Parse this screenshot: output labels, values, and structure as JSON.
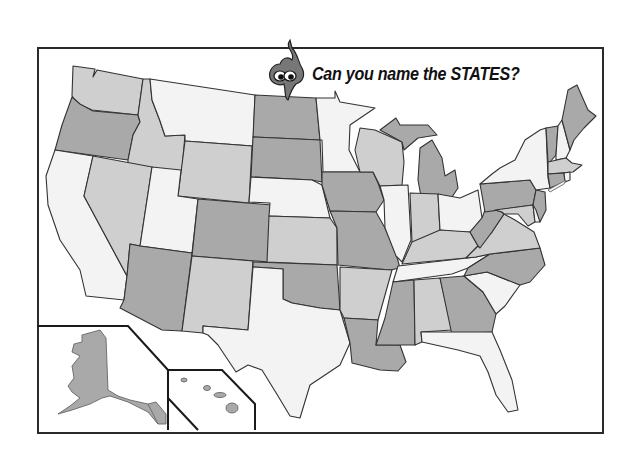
{
  "title": "Can you name the STATES?",
  "mascot": "flame-head-cartoon-character",
  "colors": {
    "dark": "#a9a9a9",
    "medium": "#cfcfcf",
    "light": "#f3f3f3",
    "border": "#2a2a2a",
    "background": "#ffffff"
  },
  "map": {
    "type": "blank-us-states-quiz-map",
    "labels_shown": false,
    "insets": [
      "Alaska",
      "Hawaii"
    ],
    "states": [
      {
        "name": "Washington",
        "shade": "medium"
      },
      {
        "name": "Oregon",
        "shade": "dark"
      },
      {
        "name": "California",
        "shade": "light"
      },
      {
        "name": "Idaho",
        "shade": "medium"
      },
      {
        "name": "Nevada",
        "shade": "medium"
      },
      {
        "name": "Montana",
        "shade": "light"
      },
      {
        "name": "Wyoming",
        "shade": "medium"
      },
      {
        "name": "Utah",
        "shade": "light"
      },
      {
        "name": "Arizona",
        "shade": "dark"
      },
      {
        "name": "Colorado",
        "shade": "dark"
      },
      {
        "name": "New Mexico",
        "shade": "medium"
      },
      {
        "name": "North Dakota",
        "shade": "dark"
      },
      {
        "name": "South Dakota",
        "shade": "dark"
      },
      {
        "name": "Nebraska",
        "shade": "light"
      },
      {
        "name": "Kansas",
        "shade": "medium"
      },
      {
        "name": "Oklahoma",
        "shade": "dark"
      },
      {
        "name": "Texas",
        "shade": "light"
      },
      {
        "name": "Minnesota",
        "shade": "light"
      },
      {
        "name": "Iowa",
        "shade": "dark"
      },
      {
        "name": "Missouri",
        "shade": "dark"
      },
      {
        "name": "Arkansas",
        "shade": "medium"
      },
      {
        "name": "Louisiana",
        "shade": "dark"
      },
      {
        "name": "Wisconsin",
        "shade": "medium"
      },
      {
        "name": "Illinois",
        "shade": "light"
      },
      {
        "name": "Michigan",
        "shade": "dark"
      },
      {
        "name": "Indiana",
        "shade": "medium"
      },
      {
        "name": "Ohio",
        "shade": "light"
      },
      {
        "name": "Kentucky",
        "shade": "medium"
      },
      {
        "name": "Tennessee",
        "shade": "light"
      },
      {
        "name": "Mississippi",
        "shade": "dark"
      },
      {
        "name": "Alabama",
        "shade": "medium"
      },
      {
        "name": "Georgia",
        "shade": "dark"
      },
      {
        "name": "Florida",
        "shade": "light"
      },
      {
        "name": "South Carolina",
        "shade": "light"
      },
      {
        "name": "North Carolina",
        "shade": "dark"
      },
      {
        "name": "Virginia",
        "shade": "medium"
      },
      {
        "name": "West Virginia",
        "shade": "dark"
      },
      {
        "name": "Pennsylvania",
        "shade": "dark"
      },
      {
        "name": "New York",
        "shade": "light"
      },
      {
        "name": "New Jersey",
        "shade": "dark"
      },
      {
        "name": "Delaware",
        "shade": "light"
      },
      {
        "name": "Maryland",
        "shade": "medium"
      },
      {
        "name": "Vermont",
        "shade": "dark"
      },
      {
        "name": "New Hampshire",
        "shade": "light"
      },
      {
        "name": "Maine",
        "shade": "dark"
      },
      {
        "name": "Massachusetts",
        "shade": "medium"
      },
      {
        "name": "Connecticut",
        "shade": "dark"
      },
      {
        "name": "Rhode Island",
        "shade": "light"
      },
      {
        "name": "Alaska",
        "shade": "dark"
      },
      {
        "name": "Hawaii",
        "shade": "dark"
      }
    ]
  }
}
